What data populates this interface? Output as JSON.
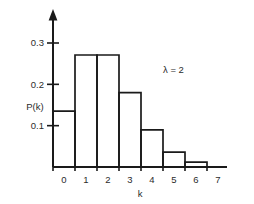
{
  "chart_data": {
    "type": "bar",
    "title": "",
    "subtitle": "",
    "xlabel": "k",
    "ylabel": "P(k)",
    "categories": [
      "0",
      "1",
      "2",
      "3",
      "4",
      "5",
      "6",
      "7"
    ],
    "values": [
      0.135,
      0.271,
      0.271,
      0.18,
      0.09,
      0.036,
      0.012,
      0.0
    ],
    "x": [
      0,
      1,
      2,
      3,
      4,
      5,
      6,
      7
    ],
    "xlim": [
      -0.5,
      7.5
    ],
    "ylim": [
      0,
      0.33
    ],
    "x_tick_labels": [
      "0",
      "1",
      "2",
      "3",
      "4",
      "5",
      "6",
      "7"
    ],
    "y_tick_labels": [
      "0.1",
      "0.2",
      "0.3"
    ],
    "y_tick_values": [
      0.1,
      0.2,
      0.3
    ],
    "grid": false,
    "legend": false,
    "legend_position": "none",
    "bar_style": "outline",
    "bar_fill": "#ffffff",
    "bar_stroke": "#1a1a1a",
    "axis_color": "#1a1a1a",
    "text_color": "#2b2b2b",
    "background": "#ffffff",
    "y_axis_arrow": true,
    "annotations": [
      {
        "name": "lambda-annotation",
        "text": "λ = 2",
        "x": 5.0,
        "y": 0.215
      }
    ]
  }
}
